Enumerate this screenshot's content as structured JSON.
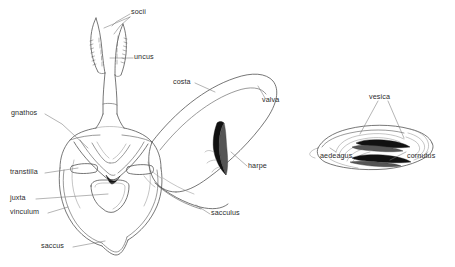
{
  "figure": {
    "background_color": "#ffffff",
    "line_color": "#4a4a4a",
    "label_color": "#2b2b2b",
    "width": 455,
    "height": 267
  },
  "labels": {
    "socii": "socii",
    "uncus": "uncus",
    "gnathos": "gnathos",
    "costa": "costa",
    "valva": "valva",
    "harpe": "harpe",
    "transtilla": "transtilla",
    "juxta": "juxta",
    "vinculum": "vinculum",
    "saccus": "saccus",
    "sacculus": "sacculus",
    "vesica": "vesica",
    "aedeagus": "aedeagus",
    "cornutus": "cornutus"
  },
  "diagrams": [
    {
      "name": "main-genitalia",
      "parts": [
        "socii",
        "uncus",
        "gnathos",
        "costa",
        "valva",
        "harpe",
        "transtilla",
        "juxta",
        "vinculum",
        "saccus",
        "sacculus"
      ]
    },
    {
      "name": "aedeagus-detail",
      "parts": [
        "vesica",
        "aedeagus",
        "cornutus"
      ]
    }
  ]
}
